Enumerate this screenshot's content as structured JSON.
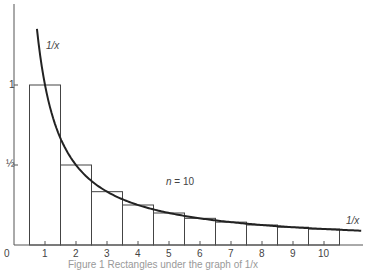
{
  "chart_data": {
    "type": "bar",
    "title": "",
    "xlabel": "",
    "ylabel": "",
    "categories": [
      "1",
      "2",
      "3",
      "4",
      "5",
      "6",
      "7",
      "8",
      "9",
      "10"
    ],
    "values": [
      1.0,
      0.5,
      0.3333,
      0.25,
      0.2,
      0.1667,
      0.1429,
      0.125,
      0.1111,
      0.1
    ],
    "bar_edges": [
      [
        0.5,
        1.5
      ],
      [
        1.5,
        2.5
      ],
      [
        2.5,
        3.5
      ],
      [
        3.5,
        4.5
      ],
      [
        4.5,
        5.5
      ],
      [
        5.5,
        6.5
      ],
      [
        6.5,
        7.5
      ],
      [
        7.5,
        8.5
      ],
      [
        8.5,
        9.5
      ],
      [
        9.5,
        10.5
      ]
    ],
    "series": [
      {
        "name": "rectangles",
        "type": "bar",
        "values": [
          1.0,
          0.5,
          0.3333,
          0.25,
          0.2,
          0.1667,
          0.1429,
          0.125,
          0.1111,
          0.1
        ]
      },
      {
        "name": "1/x",
        "type": "line",
        "function": "1/x",
        "x_range": [
          0.74,
          11.2
        ]
      }
    ],
    "x_ticks": [
      0,
      1,
      2,
      3,
      4,
      5,
      6,
      7,
      8,
      9,
      10
    ],
    "x_tick_labels": [
      "0",
      "1",
      "2",
      "3",
      "4",
      "5",
      "6",
      "7",
      "8",
      "9",
      "10"
    ],
    "y_ticks": [
      0.5,
      1
    ],
    "y_tick_labels": [
      "½",
      "1"
    ],
    "xlim": [
      0,
      11.2
    ],
    "ylim": [
      0,
      1.5
    ],
    "grid": false,
    "annotations": [
      {
        "text": "1/x",
        "x": 1.0,
        "y": 1.25
      },
      {
        "text": "n = 10",
        "x": 5.0,
        "y": 0.42
      },
      {
        "text": "1/x",
        "x": 10.9,
        "y": 0.14
      }
    ]
  },
  "labels": {
    "origin": "0",
    "y_half": "½",
    "y_one": "1",
    "curve_top": "1/x",
    "curve_right": "1/x",
    "n_label_n": "n",
    "n_label_rest": " = 10",
    "caption": "Figure 1  Rectangles under the graph of 1/x"
  },
  "style": {
    "line_color": "#222222",
    "bar_color": "#444444",
    "axis_color": "#555555"
  }
}
